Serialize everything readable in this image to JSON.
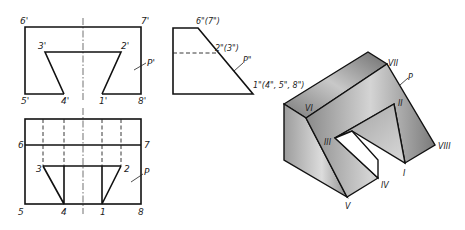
{
  "front_view": {
    "labels": {
      "p6": "6'",
      "p7": "7'",
      "p3": "3'",
      "p2": "2'",
      "p5": "5'",
      "p4": "4'",
      "p1": "1'",
      "p8": "8'",
      "plane": "P'"
    }
  },
  "side_view": {
    "labels": {
      "top": "6\"(7\")",
      "mid": "2\"(3\")",
      "plane": "P\"",
      "bottom": "1\"(4\", 5\", 8\")"
    }
  },
  "top_view": {
    "labels": {
      "p6": "6",
      "p7": "7",
      "p3": "3",
      "p2": "2",
      "p5": "5",
      "p4": "4",
      "p1": "1",
      "p8": "8",
      "plane": "P"
    }
  },
  "isometric_view": {
    "labels": {
      "I": "I",
      "II": "II",
      "III": "III",
      "IV": "IV",
      "V": "V",
      "VI": "VI",
      "VII": "VII",
      "VIII": "VIII",
      "plane": "P"
    },
    "colors": {
      "top_face": "#8a8a8a",
      "slant_face": "#a8a8a8",
      "left_face": "#9a9a9a",
      "inner_face": "#b8b8b8"
    }
  }
}
